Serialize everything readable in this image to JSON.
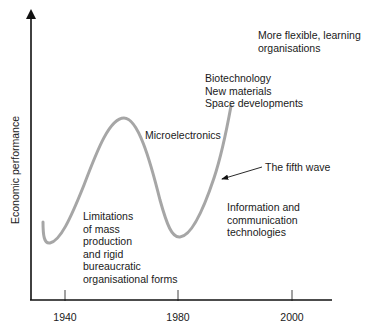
{
  "diagram": {
    "type": "wave-diagram",
    "title": "",
    "y_axis_label": "Economic performance",
    "x_axis_ticks": [
      "1940",
      "1980",
      "2000"
    ],
    "curve": {
      "color": "#a6a6a6",
      "description": "Wave rising from trough near 1940, peaking before 1980, dipping near 1980, rising again"
    },
    "annotations": {
      "microelectronics": "Microelectronics",
      "limitations": [
        "Limitations",
        "of mass",
        "production",
        "and rigid",
        "bureaucratic",
        "organisational forms"
      ],
      "biotech": [
        "Biotechnology",
        "New materials",
        "Space developments"
      ],
      "flexible": [
        "More flexible, learning",
        "organisations"
      ],
      "fifth_wave": "The fifth wave",
      "ict": [
        "Information and",
        "communication",
        "technologies"
      ]
    }
  }
}
